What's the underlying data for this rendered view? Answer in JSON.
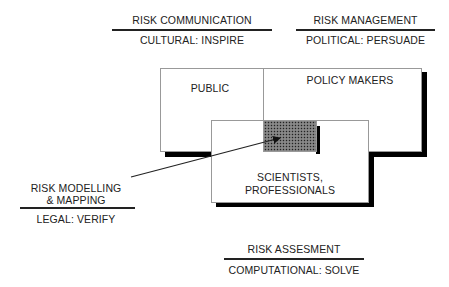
{
  "top_left": {
    "title": "RISK COMMUNICATION",
    "subtitle": "CULTURAL: INSPIRE"
  },
  "top_right": {
    "title": "RISK MANAGEMENT",
    "subtitle": "POLITICAL: PERSUADE"
  },
  "left": {
    "title_line1": "RISK MODELLING",
    "title_line2": "& MAPPING",
    "subtitle": "LEGAL: VERIFY"
  },
  "bottom": {
    "title": "RISK ASSESMENT",
    "subtitle": "COMPUTATIONAL: SOLVE"
  },
  "boxes": {
    "public": "PUBLIC",
    "policy": "POLICY MAKERS",
    "scientists_line1": "SCIENTISTS,",
    "scientists_line2": "PROFESSIONALS"
  }
}
